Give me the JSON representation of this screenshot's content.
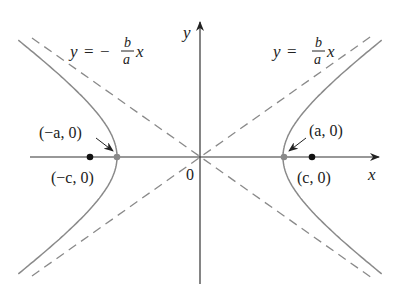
{
  "diagram": {
    "type": "hyperbola",
    "equation_hint": "x^2/a^2 - y^2/b^2 = 1",
    "axes": {
      "x_label": "x",
      "y_label": "y",
      "origin_label": "0"
    },
    "asymptotes": [
      {
        "label_lhs": "y",
        "label_eq": "=",
        "label_sign": "−",
        "label_num": "b",
        "label_den": "a",
        "label_var": "x",
        "style": "dashed"
      },
      {
        "label_lhs": "y",
        "label_eq": "=",
        "label_sign": "",
        "label_num": "b",
        "label_den": "a",
        "label_var": "x",
        "style": "dashed"
      }
    ],
    "points": {
      "left_vertex": "(−a, 0)",
      "right_vertex": "(a, 0)",
      "left_focus": "(−c, 0)",
      "right_focus": "(c, 0)"
    },
    "colors": {
      "axis": "#333333",
      "curve": "#8a8a8a",
      "asymptote": "#8a8a8a",
      "focus": "#111111",
      "vertex": "#8a8a8a",
      "text": "#222222"
    }
  }
}
